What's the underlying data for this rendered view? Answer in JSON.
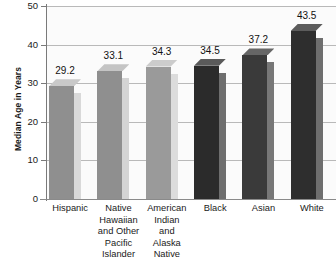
{
  "chart_data": {
    "type": "bar",
    "title": "",
    "subtitle": "",
    "xlabel": "",
    "ylabel": "Median Age in Years",
    "ylim": [
      0,
      50
    ],
    "yticks": [
      50,
      40,
      30,
      20,
      10,
      0
    ],
    "grid": true,
    "legend": "none",
    "style": "3d-bars",
    "categories": [
      "Hispanic",
      "Native\nHawaiian\nand Other\nPacific\nIslander",
      "American\nIndian\nand\nAlaska\nNative",
      "Black",
      "Asian",
      "White"
    ],
    "values": [
      29.2,
      33.1,
      34.3,
      34.5,
      37.2,
      43.5
    ],
    "data_labels": [
      "29.2",
      "33.1",
      "34.3",
      "34.5",
      "37.2",
      "43.5"
    ],
    "bar_colors": [
      "#8f8f8f",
      "#8f8f8f",
      "#9a9a9a",
      "#2b2b2b",
      "#3a3a3a",
      "#2e2e2e"
    ],
    "bar_side_colors": [
      "#d9d9d9",
      "#d4d4d4",
      "#dcdcdc",
      "#6e6e6e",
      "#777777",
      "#6e6e6e"
    ],
    "bar_top_colors": [
      "#c9c9c9",
      "#c4c4c4",
      "#cccccc",
      "#5a5a5a",
      "#666666",
      "#5c5c5c"
    ]
  },
  "colors": {
    "background": "#ffffff",
    "plot_background": "#fbfbfb",
    "gridline": "#b9b9b9",
    "axis": "#7a7a7a",
    "text": "#1a1a1a"
  }
}
